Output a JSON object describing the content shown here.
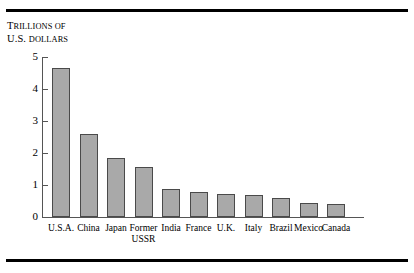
{
  "figure": {
    "rule_top": "horizontal-rule",
    "rule_bottom": "horizontal-rule"
  },
  "axis_title": {
    "line1_lead": "T",
    "line1_rest": "RILLIONS OF",
    "line2_lead": "U.S. ",
    "line2_rest": "DOLLARS"
  },
  "chart_data": {
    "type": "bar",
    "title": "",
    "subtitle": "",
    "xlabel": "",
    "ylabel": "Trillions of U.S. dollars",
    "ylim": [
      0,
      5
    ],
    "yticks": [
      0,
      1,
      2,
      3,
      4,
      5
    ],
    "ytick_labels": [
      "0",
      "1",
      "2",
      "3",
      "4",
      "5"
    ],
    "grid": false,
    "legend": false,
    "legend_position": "none",
    "bar_color": "#a9a9a9",
    "bar_edge_color": "#4a4a4a",
    "categories": [
      "U.S.A.",
      "China",
      "Japan",
      "Former USSR",
      "India",
      "France",
      "U.K.",
      "Italy",
      "Brazil",
      "Mexico",
      "Canada"
    ],
    "values": [
      4.66,
      2.59,
      1.84,
      1.56,
      0.87,
      0.78,
      0.72,
      0.69,
      0.59,
      0.44,
      0.42
    ]
  },
  "category_label_lines": [
    [
      "U.S.A."
    ],
    [
      "China"
    ],
    [
      "Japan"
    ],
    [
      "Former",
      "USSR"
    ],
    [
      "India"
    ],
    [
      "France"
    ],
    [
      "U.K."
    ],
    [
      "Italy"
    ],
    [
      "Brazil"
    ],
    [
      "Mexico"
    ],
    [
      "Canada"
    ]
  ]
}
